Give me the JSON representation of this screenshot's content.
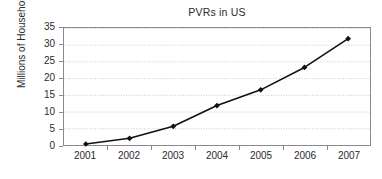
{
  "chart_data": {
    "type": "line",
    "title": "PVRs in US",
    "xlabel": "",
    "ylabel": "Millions of Households",
    "categories": [
      "2001",
      "2002",
      "2003",
      "2004",
      "2005",
      "2006",
      "2007"
    ],
    "values": [
      0.3,
      2,
      5.6,
      11.8,
      16.5,
      23.2,
      31.8
    ],
    "series": [
      {
        "name": "PVR households",
        "values": [
          0.3,
          2,
          5.6,
          11.8,
          16.5,
          23.2,
          31.8
        ]
      }
    ],
    "ylim": [
      0,
      35
    ],
    "yticks": [
      0,
      5,
      10,
      15,
      20,
      25,
      30,
      35
    ],
    "ytick_labels": [
      "0",
      "5",
      "10",
      "15",
      "20",
      "25",
      "30",
      "35"
    ],
    "grid": true,
    "grid_axis": "y",
    "grid_style": "dotted",
    "legend": false,
    "legend_position": "none",
    "marker": "diamond",
    "line_color": "#111111",
    "marker_color": "#111111",
    "grid_color": "#c9c9c9",
    "axis_color": "#8a8a8a",
    "background_color": "#ffffff"
  }
}
